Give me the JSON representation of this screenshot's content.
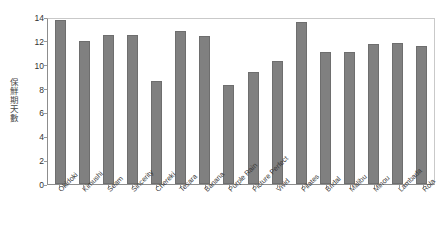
{
  "chart_data": {
    "type": "bar",
    "title": "",
    "xlabel": "",
    "ylabel": "保鮮期天數",
    "ylim": [
      0,
      14
    ],
    "yticks": [
      0,
      2,
      4,
      6,
      8,
      10,
      12,
      14
    ],
    "grid": false,
    "legend": false,
    "bar_color": "#808080",
    "categories": [
      "Okidoki",
      "Kimushi",
      "Seam",
      "Sincerity",
      "Chereki",
      "Tesara",
      "Banana",
      "Purple Rain",
      "Picture Perfect",
      "Vivid",
      "Pilates",
      "Bridal",
      "Malibu",
      "Minou",
      "Lambada",
      "Rola"
    ],
    "values": [
      13.75,
      12.0,
      12.5,
      12.5,
      8.65,
      12.8,
      12.4,
      8.3,
      9.35,
      10.35,
      13.55,
      11.05,
      11.1,
      11.75,
      11.85,
      11.6
    ]
  }
}
